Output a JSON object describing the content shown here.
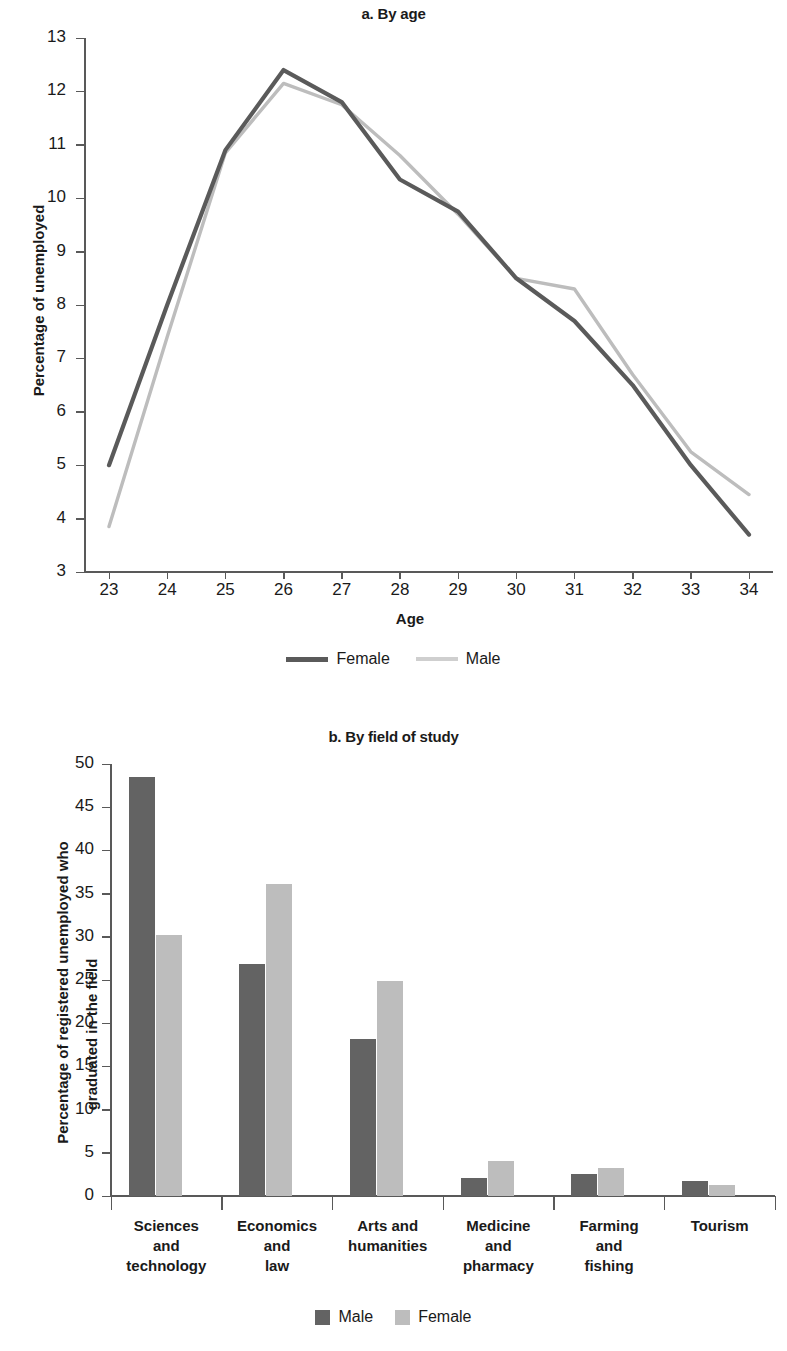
{
  "figure": {
    "colors": {
      "male_dark": "#636363",
      "female_dark": "#5a5a5a",
      "light_gray": "#bdbdbd",
      "axis": "#595959",
      "text": "#1a1a1a"
    }
  },
  "panel_a": {
    "title": "a. By age",
    "ylabel": "Percentage of unemployed",
    "xlabel": "Age",
    "legend": [
      {
        "label": "Female",
        "color": "#5a5a5a",
        "style": "line-solid-dark"
      },
      {
        "label": "Male",
        "color": "#bdbdbd",
        "style": "line-solid-light"
      }
    ]
  },
  "panel_b": {
    "title": "b. By field of study",
    "ylabel": "Percentage  of registered unemployed who\ngraduated in the field",
    "ylabel_line1": "Percentage  of registered unemployed who",
    "ylabel_line2": "graduated in the field",
    "legend": [
      {
        "label": "Male",
        "color": "#636363"
      },
      {
        "label": "Female",
        "color": "#bdbdbd"
      }
    ]
  },
  "chart_data": [
    {
      "type": "line",
      "title": "a. By age",
      "xlabel": "Age",
      "ylabel": "Percentage of unemployed",
      "x": [
        23,
        24,
        25,
        26,
        27,
        28,
        29,
        30,
        31,
        32,
        33,
        34
      ],
      "xticklabels": [
        "23",
        "24",
        "25",
        "26",
        "27",
        "28",
        "29",
        "30",
        "31",
        "32",
        "33",
        "34"
      ],
      "yticklabels": [
        "3",
        "4",
        "5",
        "6",
        "7",
        "8",
        "9",
        "10",
        "11",
        "12",
        "13"
      ],
      "ylim": [
        3,
        13
      ],
      "xlim": [
        23,
        34
      ],
      "grid": false,
      "legend_position": "bottom",
      "series": [
        {
          "name": "Female",
          "color": "#5a5a5a",
          "values": [
            5.0,
            8.0,
            10.9,
            12.4,
            11.8,
            10.35,
            9.75,
            8.5,
            7.7,
            6.5,
            5.0,
            3.7
          ]
        },
        {
          "name": "Male",
          "color": "#bdbdbd",
          "values": [
            3.85,
            7.4,
            10.85,
            12.15,
            11.75,
            10.8,
            9.7,
            8.5,
            8.3,
            6.7,
            5.25,
            4.45
          ]
        }
      ]
    },
    {
      "type": "bar",
      "title": "b. By field of study",
      "xlabel": "",
      "ylabel": "Percentage  of registered unemployed who graduated in the field",
      "categories": [
        "Sciences\nand\ntechnology",
        "Economics\nand\nlaw",
        "Arts and\nhumanities",
        "Medicine\nand\npharmacy",
        "Farming\nand\nfishing",
        "Tourism"
      ],
      "yticklabels": [
        "0",
        "5",
        "10",
        "15",
        "20",
        "25",
        "30",
        "35",
        "40",
        "45",
        "50"
      ],
      "ylim": [
        0,
        50
      ],
      "grid": false,
      "legend_position": "bottom",
      "series": [
        {
          "name": "Male",
          "color": "#636363",
          "values": [
            48.5,
            26.8,
            18.2,
            2.1,
            2.6,
            1.7
          ]
        },
        {
          "name": "Female",
          "color": "#bdbdbd",
          "values": [
            30.2,
            36.1,
            24.9,
            4.1,
            3.2,
            1.3
          ]
        }
      ]
    }
  ]
}
